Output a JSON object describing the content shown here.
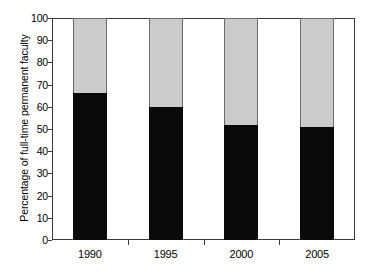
{
  "chart_data": {
    "type": "bar",
    "subtype": "stacked-100",
    "title": "",
    "subtitle": "",
    "xlabel": "",
    "ylabel": "Percentage of full-time permanent faculty",
    "categories": [
      "1990",
      "1995",
      "2000",
      "2005"
    ],
    "series": [
      {
        "name": "lower-segment",
        "color": "#0a0a0a",
        "values": [
          66,
          60,
          52,
          51
        ]
      },
      {
        "name": "upper-segment",
        "color": "#cbcbcb",
        "values": [
          34,
          40,
          48,
          49
        ]
      }
    ],
    "ylim": [
      0,
      100
    ],
    "yticks": [
      0,
      10,
      20,
      30,
      40,
      50,
      60,
      70,
      80,
      90,
      100
    ],
    "ytick_labels": [
      "0",
      "10",
      "20",
      "30",
      "40",
      "50",
      "60",
      "70",
      "80",
      "90",
      "100"
    ],
    "xticks": [
      "1990",
      "1995",
      "2000",
      "2005"
    ],
    "grid": false,
    "legend": null,
    "legend_position": "none",
    "annotations": []
  },
  "axis": {
    "y_title": "Percentage of full-time permanent faculty",
    "y_labels": [
      "100",
      "90",
      "80",
      "70",
      "60",
      "50",
      "40",
      "30",
      "20",
      "10",
      "0"
    ],
    "x_labels": [
      "1990",
      "1995",
      "2000",
      "2005"
    ]
  },
  "colors": {
    "upper_fill": "#cbcbcb",
    "lower_fill": "#0a0a0a",
    "frame": "#3a3a3a",
    "background": "#ffffff"
  }
}
